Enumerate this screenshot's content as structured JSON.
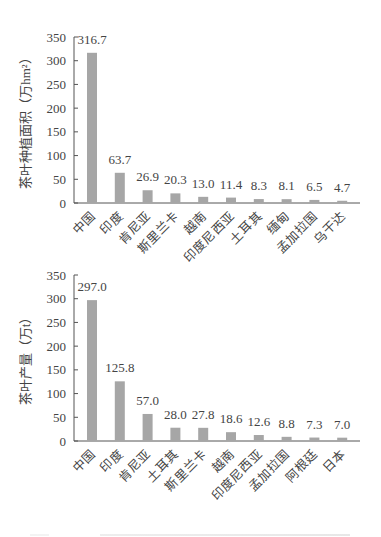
{
  "chart_data": [
    {
      "type": "bar",
      "title": "",
      "xlabel": "",
      "ylabel": "茶叶种植面积（万hm²）",
      "ylim": [
        0,
        350
      ],
      "yticks": [
        0,
        50,
        100,
        150,
        200,
        250,
        300,
        350
      ],
      "categories": [
        "中国",
        "印度",
        "肯尼亚",
        "斯里兰卡",
        "越南",
        "印度尼西亚",
        "土耳其",
        "缅甸",
        "孟加拉国",
        "乌干达"
      ],
      "values": [
        316.7,
        63.7,
        26.9,
        20.3,
        13.0,
        11.4,
        8.3,
        8.1,
        6.5,
        4.7
      ],
      "data_labels": [
        "316.7",
        "63.7",
        "26.9",
        "20.3",
        "13.0",
        "11.4",
        "8.3",
        "8.1",
        "6.5",
        "4.7"
      ],
      "grid": false,
      "bar_color": "#a6a6a6"
    },
    {
      "type": "bar",
      "title": "",
      "xlabel": "",
      "ylabel": "茶叶产量（万t）",
      "ylim": [
        0,
        350
      ],
      "yticks": [
        0,
        50,
        100,
        150,
        200,
        250,
        300,
        350
      ],
      "categories": [
        "中国",
        "印度",
        "肯尼亚",
        "土耳其",
        "斯里兰卡",
        "越南",
        "印度尼西亚",
        "孟加拉国",
        "阿根廷",
        "日本"
      ],
      "values": [
        297.0,
        125.8,
        57.0,
        28.0,
        27.8,
        18.6,
        12.6,
        8.8,
        7.3,
        7.0
      ],
      "data_labels": [
        "297.0",
        "125.8",
        "57.0",
        "28.0",
        "27.8",
        "18.6",
        "12.6",
        "8.8",
        "7.3",
        "7.0"
      ],
      "grid": false,
      "bar_color": "#a6a6a6"
    }
  ]
}
